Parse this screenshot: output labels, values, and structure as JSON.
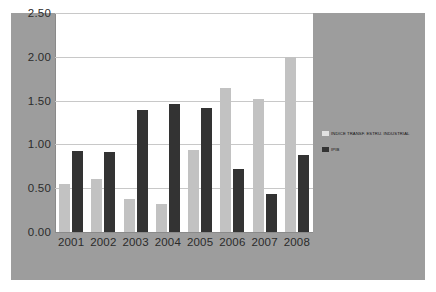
{
  "chart_data": {
    "type": "bar",
    "title": "",
    "xlabel": "",
    "ylabel": "",
    "categories": [
      "2001",
      "2002",
      "2003",
      "2004",
      "2005",
      "2006",
      "2007",
      "2008"
    ],
    "series": [
      {
        "name": "INDICE TRANSF. ESTRU. INDUSTRIAL",
        "color": "#c2c2c2",
        "values": [
          0.55,
          0.61,
          0.38,
          0.32,
          0.94,
          1.64,
          1.52,
          2.0
        ]
      },
      {
        "name": "IPIB",
        "color": "#333333",
        "values": [
          0.93,
          0.91,
          1.39,
          1.46,
          1.41,
          0.72,
          0.43,
          0.88
        ]
      }
    ],
    "ylim": [
      0.0,
      2.5
    ],
    "ytick_values": [
      0.0,
      0.5,
      1.0,
      1.5,
      2.0,
      2.5
    ],
    "ytick_labels": [
      "0.00",
      "0.50",
      "1.00",
      "1.50",
      "2.00",
      "2.50"
    ],
    "grid": true,
    "legend_position": "right"
  },
  "colors": {
    "canvas_background": "#9d9d9d",
    "plot_background": "#ffffff",
    "gridline": "#c8c8c8",
    "axis": "#8a8a8a",
    "tick_text": "#2b2b2b"
  }
}
